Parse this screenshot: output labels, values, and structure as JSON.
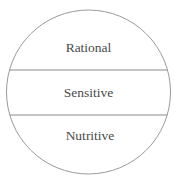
{
  "diagram": {
    "title": "",
    "sections": [
      {
        "label": "Rational"
      },
      {
        "label": "Sensitive"
      },
      {
        "label": "Nutritive"
      }
    ],
    "colors": {
      "stroke": "#9a9a9a",
      "text": "#4a4a4a",
      "background": "#ffffff"
    }
  }
}
